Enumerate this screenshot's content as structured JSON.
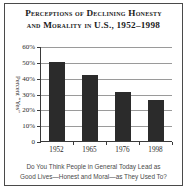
{
  "chart_data": {
    "type": "bar",
    "title": "Perceptions of Declining Honesty and Morality in U.S., 1952–1998",
    "title_line1": "Perceptions of Declining Honesty",
    "title_line2": "and Morality in U.S., 1952–1998",
    "categories": [
      "1952",
      "1965",
      "1976",
      "1998"
    ],
    "values": [
      50,
      42,
      31,
      26
    ],
    "xlabel": "",
    "ylabel": "Percent “Yes”",
    "ylim": [
      0,
      60
    ],
    "ytick_labels": [
      "60%",
      "50%",
      "40%",
      "30%",
      "20%",
      "10%",
      "0"
    ],
    "ytick_values": [
      60,
      50,
      40,
      30,
      20,
      10,
      0
    ],
    "grid": true,
    "legend": "none",
    "bar_color": "#2b2b2b",
    "grid_color": "#9a9a9a",
    "axis_color": "#3a3a3a",
    "caption": "Do You Think People in General Today Lead as Good Lives—Honest and Moral—as They Used To?",
    "caption_line1": "Do You Think People in General Today Lead as",
    "caption_line2": "Good Lives—Honest and Moral—as They Used To?"
  }
}
